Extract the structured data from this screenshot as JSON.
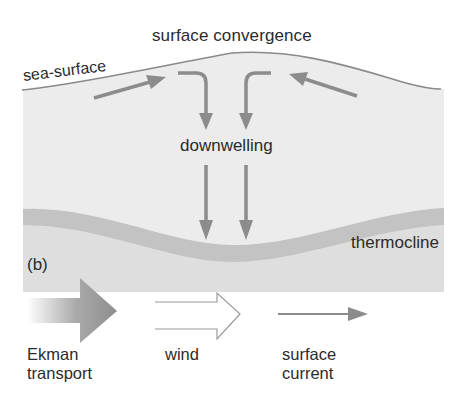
{
  "figure": {
    "panel_label": "(b)",
    "labels": {
      "title": "surface convergence",
      "sea_surface": "sea-surface",
      "downwelling": "downwelling",
      "thermocline": "thermocline"
    },
    "legend": {
      "items": [
        {
          "symbol": "gradient-block-arrow",
          "line1": "Ekman",
          "line2": "transport"
        },
        {
          "symbol": "hollow-double-arrow",
          "line1": "wind",
          "line2": ""
        },
        {
          "symbol": "thin-arrow",
          "line1": "surface",
          "line2": "current"
        }
      ]
    },
    "colors": {
      "water": "#ececec",
      "deep_water": "#dcdcdc",
      "thermocline_band": "#c4c4c4",
      "arrow": "#8c8c8c",
      "surface_line": "#8a8a8a",
      "text": "#2b2b2b"
    }
  }
}
